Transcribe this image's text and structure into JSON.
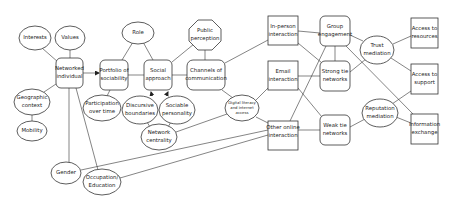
{
  "diagram": {
    "nodes": {
      "interests": {
        "label": [
          "Interests"
        ],
        "shape": "ellipse"
      },
      "values": {
        "label": [
          "Values"
        ],
        "shape": "ellipse"
      },
      "networked_individual": {
        "label": [
          "Networked",
          "individual"
        ],
        "shape": "rounded-rect"
      },
      "geographic_context": {
        "label": [
          "Geographic",
          "context"
        ],
        "shape": "ellipse"
      },
      "mobility": {
        "label": [
          "Mobility"
        ],
        "shape": "ellipse"
      },
      "portfolio_of_sociability": {
        "label": [
          "Portfolio of",
          "sociability"
        ],
        "shape": "rounded-rect"
      },
      "participation_over_time": {
        "label": [
          "Participation",
          "over time"
        ],
        "shape": "ellipse"
      },
      "role": {
        "label": [
          "Role"
        ],
        "shape": "ellipse"
      },
      "social_approach": {
        "label": [
          "Social",
          "approach"
        ],
        "shape": "rounded-rect"
      },
      "public_perception": {
        "label": [
          "Public",
          "perception"
        ],
        "shape": "octagon"
      },
      "channels_of_communication": {
        "label": [
          "Channels of",
          "communication"
        ],
        "shape": "rounded-rect"
      },
      "discursive_boundaries": {
        "label": [
          "Discursive",
          "boundaries"
        ],
        "shape": "ellipse"
      },
      "sociable_personality": {
        "label": [
          "Sociable",
          "personality"
        ],
        "shape": "ellipse"
      },
      "network_centrality": {
        "label": [
          "Network",
          "centrality"
        ],
        "shape": "ellipse"
      },
      "digital_literacy": {
        "label": [
          "Digital literacy",
          "and internet",
          "access"
        ],
        "shape": "ellipse"
      },
      "in_person_interaction": {
        "label": [
          "In-person",
          "interaction"
        ],
        "shape": "rect"
      },
      "email_interaction": {
        "label": [
          "Email",
          "interaction"
        ],
        "shape": "rect"
      },
      "other_online_interaction": {
        "label": [
          "Other online",
          "interaction"
        ],
        "shape": "rect"
      },
      "group_engagement": {
        "label": [
          "Group",
          "engagement"
        ],
        "shape": "rounded-rect"
      },
      "strong_tie_networks": {
        "label": [
          "Strong tie",
          "networks"
        ],
        "shape": "rounded-rect"
      },
      "weak_tie_networks": {
        "label": [
          "Weak tie",
          "networks"
        ],
        "shape": "rounded-rect"
      },
      "trust_mediation": {
        "label": [
          "Trust",
          "mediation"
        ],
        "shape": "ellipse"
      },
      "reputation_mediation": {
        "label": [
          "Reputation",
          "mediation"
        ],
        "shape": "ellipse"
      },
      "access_to_resources": {
        "label": [
          "Access to",
          "resources"
        ],
        "shape": "rect"
      },
      "access_to_support": {
        "label": [
          "Access to",
          "support"
        ],
        "shape": "rect"
      },
      "information_exchange": {
        "label": [
          "Information",
          "exchange"
        ],
        "shape": "rect"
      },
      "gender": {
        "label": [
          "Gender"
        ],
        "shape": "ellipse"
      },
      "occupation_education": {
        "label": [
          "Occupation/",
          "Education"
        ],
        "shape": "ellipse"
      }
    },
    "edges": [
      [
        "interests",
        "networked_individual"
      ],
      [
        "values",
        "networked_individual"
      ],
      [
        "geographic_context",
        "networked_individual"
      ],
      [
        "geographic_context",
        "mobility"
      ],
      [
        "networked_individual",
        "portfolio_of_sociability",
        "arrow"
      ],
      [
        "networked_individual",
        "gender"
      ],
      [
        "networked_individual",
        "occupation_education"
      ],
      [
        "portfolio_of_sociability",
        "participation_over_time"
      ],
      [
        "portfolio_of_sociability",
        "role"
      ],
      [
        "portfolio_of_sociability",
        "social_approach"
      ],
      [
        "role",
        "social_approach"
      ],
      [
        "social_approach",
        "public_perception"
      ],
      [
        "social_approach",
        "channels_of_communication"
      ],
      [
        "social_approach",
        "discursive_boundaries",
        "arrow"
      ],
      [
        "social_approach",
        "sociable_personality",
        "arrow"
      ],
      [
        "discursive_boundaries",
        "network_centrality"
      ],
      [
        "sociable_personality",
        "network_centrality"
      ],
      [
        "network_centrality",
        "digital_literacy"
      ],
      [
        "public_perception",
        "channels_of_communication"
      ],
      [
        "channels_of_communication",
        "in_person_interaction"
      ],
      [
        "channels_of_communication",
        "digital_literacy"
      ],
      [
        "digital_literacy",
        "email_interaction"
      ],
      [
        "digital_literacy",
        "other_online_interaction"
      ],
      [
        "gender",
        "other_online_interaction"
      ],
      [
        "occupation_education",
        "other_online_interaction"
      ],
      [
        "in_person_interaction",
        "group_engagement"
      ],
      [
        "in_person_interaction",
        "strong_tie_networks"
      ],
      [
        "email_interaction",
        "strong_tie_networks"
      ],
      [
        "email_interaction",
        "weak_tie_networks"
      ],
      [
        "other_online_interaction",
        "weak_tie_networks"
      ],
      [
        "other_online_interaction",
        "group_engagement"
      ],
      [
        "group_engagement",
        "strong_tie_networks"
      ],
      [
        "group_engagement",
        "trust_mediation"
      ],
      [
        "group_engagement",
        "information_exchange"
      ],
      [
        "strong_tie_networks",
        "trust_mediation"
      ],
      [
        "weak_tie_networks",
        "reputation_mediation"
      ],
      [
        "trust_mediation",
        "access_to_resources"
      ],
      [
        "trust_mediation",
        "access_to_support"
      ],
      [
        "reputation_mediation",
        "access_to_support"
      ],
      [
        "reputation_mediation",
        "information_exchange"
      ]
    ]
  }
}
